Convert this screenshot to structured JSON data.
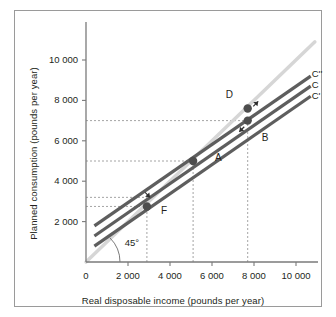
{
  "figure": {
    "background": "#ffffff",
    "border_color": "#9a9a9a",
    "line_color": "#5e5e5e",
    "guide_color": "#d6d6d6",
    "dash_color": "#8d8d8d",
    "point_color": "#4d4d4d",
    "text_color": "#231f20"
  },
  "chart_data": {
    "type": "line",
    "title": "",
    "xlabel": "Real disposable income (pounds per year)",
    "ylabel": "Planned consumption (pounds per year)",
    "xlim": [
      0,
      11000
    ],
    "ylim": [
      0,
      11200
    ],
    "grid": false,
    "legend_position": "right-of-lines",
    "xticks": [
      0,
      2000,
      4000,
      6000,
      8000,
      10000
    ],
    "xticklabels": [
      "0",
      "2 000",
      "4 000",
      "6 000",
      "8 000",
      "10 000"
    ],
    "yticks": [
      2000,
      4000,
      6000,
      8000,
      10000
    ],
    "yticklabels": [
      "2 000",
      "4 000",
      "6 000",
      "8 000",
      "10 000"
    ],
    "series": [
      {
        "name": "C''",
        "label": "C''",
        "intercept": 1500,
        "slope": 0.72,
        "x_from": 400,
        "x_to": 10700,
        "label_x": 10750,
        "label_y": 9250
      },
      {
        "name": "C",
        "label": "C",
        "intercept": 1000,
        "slope": 0.72,
        "x_from": 400,
        "x_to": 10700,
        "label_x": 10750,
        "label_y": 8700
      },
      {
        "name": "C'",
        "label": "C'",
        "intercept": 500,
        "slope": 0.72,
        "x_from": 400,
        "x_to": 10700,
        "label_x": 10750,
        "label_y": 8150
      },
      {
        "name": "45-degree-line",
        "label": "45°",
        "intercept": 0,
        "slope": 1.0,
        "x_from": 0,
        "x_to": 10900,
        "label_x": 1750,
        "label_y": 900
      }
    ],
    "points": [
      {
        "label": "A",
        "x": 5100,
        "y": 5000,
        "label_dx": 22,
        "label_dy": -2
      },
      {
        "label": "B",
        "x": 7700,
        "y": 7000,
        "label_dx": 14,
        "label_dy": 18
      },
      {
        "label": "D",
        "x": 7700,
        "y": 7600,
        "label_dx": -22,
        "label_dy": -12
      },
      {
        "label": "F",
        "x": 2900,
        "y": 2750,
        "label_dx": 14,
        "label_dy": 6
      }
    ],
    "dashed_guides": [
      {
        "orientation": "horizontal",
        "value": 7000,
        "from": 0,
        "to": 7700
      },
      {
        "orientation": "horizontal",
        "value": 5000,
        "from": 0,
        "to": 5100
      },
      {
        "orientation": "horizontal",
        "value": 3200,
        "from": 0,
        "to": 2900
      },
      {
        "orientation": "horizontal",
        "value": 2750,
        "from": 0,
        "to": 2900
      },
      {
        "orientation": "vertical",
        "value": 2900,
        "from": 0,
        "to": 2750
      },
      {
        "orientation": "vertical",
        "value": 5100,
        "from": 0,
        "to": 5000
      },
      {
        "orientation": "vertical",
        "value": 7700,
        "from": 0,
        "to": 7000
      }
    ],
    "annotations": [
      {
        "name": "arrow-up-from-C-to-Cdoubleprime",
        "x": 8200,
        "y": 7950,
        "direction": "up-right"
      },
      {
        "name": "arrow-down-from-C-to-Cprime",
        "x": 7300,
        "y": 6450,
        "direction": "down-left"
      },
      {
        "name": "arrow-down-at-F",
        "x": 3050,
        "y": 3200,
        "direction": "down-right"
      },
      {
        "name": "angle-arc-45",
        "x": 0,
        "y": 0,
        "direction": "arc"
      }
    ]
  }
}
